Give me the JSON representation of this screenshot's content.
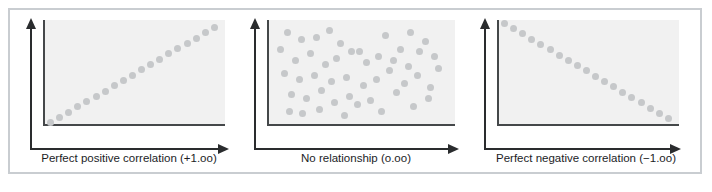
{
  "figure": {
    "border_color": "#c9cdd1",
    "background": "#ffffff",
    "plot_background": "#f1f1f1",
    "axis_color": "#2a2c2e",
    "frame_color": "#45484a",
    "dot_color": "#c6c8ca"
  },
  "chart_data": [
    {
      "type": "scatter",
      "title": "Perfect positive correlation (+1.oo)",
      "caption": "Perfect positive correlation (+1.oo)",
      "correlation": 1.0,
      "xlabel": "",
      "ylabel": "",
      "xlim": [
        0,
        100
      ],
      "ylim": [
        0,
        100
      ],
      "grid": false,
      "legend": "none",
      "axis_arrows": true,
      "x": [
        3,
        8,
        13,
        18,
        23,
        28,
        33,
        38,
        43,
        48,
        53,
        58,
        63,
        68,
        73,
        78,
        83,
        88,
        93
      ],
      "y": [
        3,
        8,
        13,
        18,
        23,
        28,
        33,
        38,
        43,
        48,
        53,
        58,
        63,
        68,
        73,
        78,
        83,
        88,
        93
      ]
    },
    {
      "type": "scatter",
      "title": "No relationship (o.oo)",
      "caption": "No relationship (o.oo)",
      "correlation": 0.0,
      "xlabel": "",
      "ylabel": "",
      "xlim": [
        0,
        100
      ],
      "ylim": [
        0,
        100
      ],
      "grid": false,
      "legend": "none",
      "axis_arrows": true,
      "x": [
        10,
        17,
        25,
        32,
        38,
        48,
        62,
        70,
        75,
        83,
        88,
        6,
        14,
        22,
        30,
        36,
        44,
        52,
        58,
        66,
        74,
        80,
        90,
        8,
        16,
        24,
        33,
        41,
        50,
        57,
        64,
        72,
        79,
        86,
        12,
        20,
        28,
        35,
        43,
        54,
        68,
        77,
        85,
        11,
        18,
        27,
        40,
        47,
        60
      ],
      "y": [
        88,
        82,
        84,
        90,
        78,
        70,
        85,
        72,
        88,
        80,
        66,
        72,
        62,
        68,
        58,
        64,
        70,
        60,
        66,
        62,
        56,
        70,
        54,
        50,
        44,
        48,
        42,
        46,
        38,
        44,
        52,
        40,
        48,
        36,
        30,
        26,
        34,
        22,
        28,
        24,
        32,
        18,
        26,
        14,
        12,
        16,
        10,
        20,
        14
      ]
    },
    {
      "type": "scatter",
      "title": "Perfect negative correlation (−1.oo)",
      "caption": "Perfect negative correlation (−1.oo)",
      "correlation": -1.0,
      "xlabel": "",
      "ylabel": "",
      "xlim": [
        0,
        100
      ],
      "ylim": [
        0,
        100
      ],
      "grid": false,
      "legend": "none",
      "axis_arrows": true,
      "x": [
        3,
        8,
        13,
        18,
        23,
        28,
        33,
        38,
        43,
        48,
        53,
        58,
        63,
        68,
        73,
        78,
        83,
        88,
        93
      ],
      "y": [
        97,
        92,
        87,
        82,
        77,
        72,
        67,
        62,
        57,
        52,
        47,
        42,
        37,
        32,
        27,
        22,
        17,
        12,
        7
      ]
    }
  ],
  "panels": [
    {
      "name": "positive-correlation-panel",
      "caption": "Perfect positive correlation (+1.oo)"
    },
    {
      "name": "no-relationship-panel",
      "caption": "No relationship (o.oo)"
    },
    {
      "name": "negative-correlation-panel",
      "caption": "Perfect negative correlation (−1.oo)"
    }
  ]
}
